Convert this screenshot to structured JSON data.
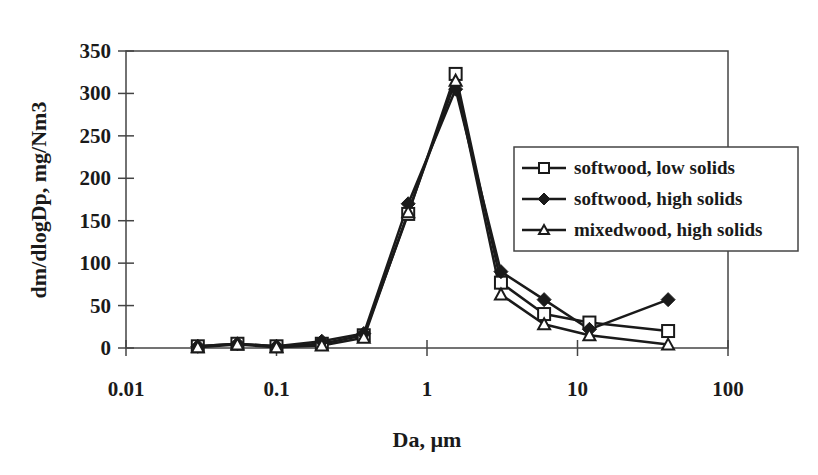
{
  "chart_data": {
    "type": "line",
    "title": "",
    "xlabel": "Da, µm",
    "ylabel": "dm/dlogDp, mg/Nm3",
    "xscale": "log",
    "xlim": [
      0.01,
      100
    ],
    "ylim": [
      0,
      350
    ],
    "xticks": [
      0.01,
      0.1,
      1,
      10,
      100
    ],
    "xtick_labels": [
      "0.01",
      "0.1",
      "1",
      "10",
      "100"
    ],
    "yticks": [
      0,
      50,
      100,
      150,
      200,
      250,
      300,
      350
    ],
    "ytick_labels": [
      "0",
      "50",
      "100",
      "150",
      "200",
      "250",
      "300",
      "350"
    ],
    "grid": false,
    "legend_position": "right-center (boxed, inside plot)",
    "x": [
      0.03,
      0.055,
      0.1,
      0.2,
      0.38,
      0.75,
      1.55,
      3.1,
      6.0,
      12.0,
      40.0
    ],
    "series": [
      {
        "name": "softwood, low solids",
        "marker": "square-open",
        "values": [
          2,
          5,
          2,
          5,
          15,
          158,
          323,
          77,
          40,
          30,
          20
        ]
      },
      {
        "name": "softwood, high solids",
        "marker": "diamond-filled",
        "values": [
          2,
          5,
          2,
          8,
          17,
          170,
          305,
          90,
          57,
          22,
          57
        ]
      },
      {
        "name": "mixedwood, high solids",
        "marker": "triangle-open",
        "values": [
          1,
          4,
          1,
          3,
          12,
          160,
          315,
          63,
          28,
          15,
          4
        ]
      }
    ]
  },
  "colors": {
    "ink": "#1a1a1a",
    "background": "#ffffff"
  }
}
